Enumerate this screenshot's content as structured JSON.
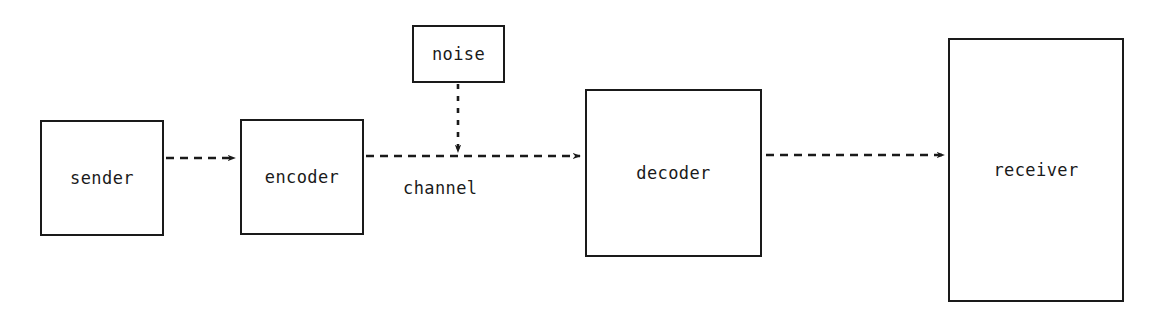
{
  "diagram": {
    "background_color": "#ffffff",
    "stroke_color": "#1a1a1a",
    "nodes": [
      {
        "id": "sender",
        "label": "sender",
        "x": 40,
        "y": 120,
        "w": 124,
        "h": 116
      },
      {
        "id": "encoder",
        "label": "encoder",
        "x": 240,
        "y": 119,
        "w": 124,
        "h": 116
      },
      {
        "id": "noise",
        "label": "noise",
        "x": 412,
        "y": 25,
        "w": 93,
        "h": 58
      },
      {
        "id": "decoder",
        "label": "decoder",
        "x": 585,
        "y": 89,
        "w": 177,
        "h": 168
      },
      {
        "id": "receiver",
        "label": "receiver",
        "x": 948,
        "y": 38,
        "w": 176,
        "h": 264
      }
    ],
    "edges": [
      {
        "id": "sender-to-encoder",
        "from": "sender",
        "to": "encoder",
        "style": "dashed",
        "arrow": "end",
        "label": ""
      },
      {
        "id": "encoder-to-decoder",
        "from": "encoder",
        "to": "decoder",
        "style": "dashed",
        "arrow": "end",
        "label": "channel"
      },
      {
        "id": "noise-to-channel",
        "from": "noise",
        "to": "channel",
        "style": "dashed",
        "arrow": "end",
        "label": ""
      },
      {
        "id": "decoder-to-receiver",
        "from": "decoder",
        "to": "receiver",
        "style": "dashed",
        "arrow": "end",
        "label": ""
      }
    ],
    "edge_labels": [
      {
        "id": "channel-label",
        "text": "channel",
        "x": 403,
        "y": 178
      }
    ]
  }
}
